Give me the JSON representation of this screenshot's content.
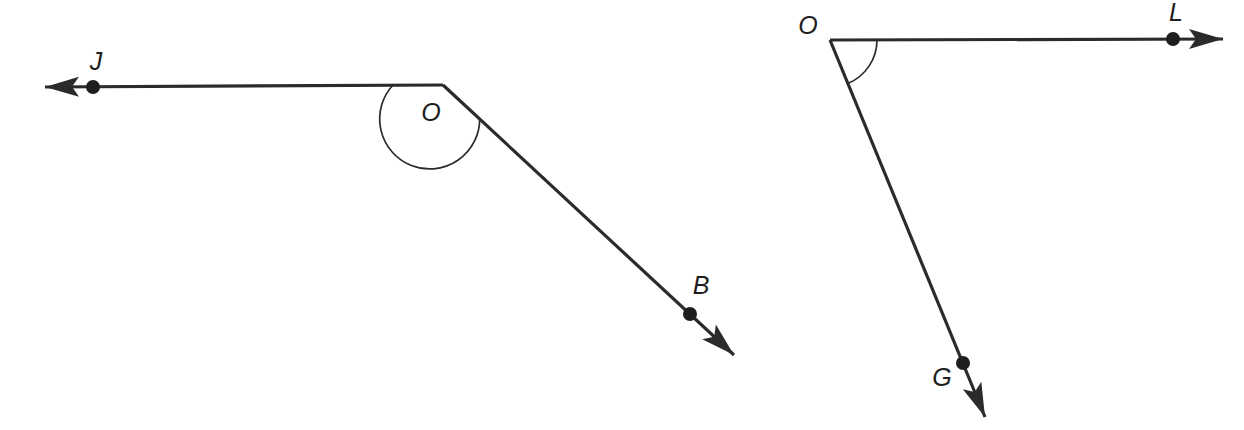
{
  "figure": {
    "type": "geometry-angle-diagram",
    "background_color": "#ffffff",
    "line_color": "#2b2b2b",
    "label_color": "#1e1e1e",
    "width": 1244,
    "height": 430,
    "diagrams": [
      {
        "id": "angle-job",
        "name": "angle-JOB",
        "vertex": {
          "label": "O",
          "x": 443,
          "y": 85,
          "label_x": 431,
          "label_y": 114
        },
        "rays": [
          {
            "name": "ray-OJ",
            "endpoint_label": "J",
            "from_x": 443,
            "from_y": 85,
            "to_x": 93,
            "to_y": 87,
            "tip_x": 45,
            "tip_y": 87,
            "dot_x": 93,
            "dot_y": 87,
            "label_x": 96,
            "label_y": 63,
            "direction_deg": 180
          },
          {
            "name": "ray-OB",
            "endpoint_label": "B",
            "from_x": 443,
            "from_y": 85,
            "to_x": 690,
            "to_y": 314,
            "tip_x": 734,
            "tip_y": 355,
            "dot_x": 690,
            "dot_y": 314,
            "label_x": 701,
            "label_y": 287,
            "direction_deg": 42.8
          }
        ],
        "arc": {
          "name": "angle-arc-JOB",
          "radius": 50,
          "start_deg": 180,
          "end_deg": 42.8,
          "sweep": "counterclockwise-over-top",
          "measure_type": "reflex-marked"
        }
      },
      {
        "id": "angle-log",
        "name": "angle-LOG",
        "vertex": {
          "label": "O",
          "x": 830,
          "y": 40,
          "label_x": 808,
          "label_y": 27
        },
        "rays": [
          {
            "name": "ray-OL",
            "endpoint_label": "L",
            "from_x": 830,
            "from_y": 40,
            "to_x": 1173,
            "to_y": 39,
            "tip_x": 1223,
            "tip_y": 39,
            "dot_x": 1173,
            "dot_y": 39,
            "label_x": 1176,
            "label_y": 14,
            "direction_deg": 0
          },
          {
            "name": "ray-OG",
            "endpoint_label": "G",
            "from_x": 830,
            "from_y": 40,
            "to_x": 963,
            "to_y": 363,
            "tip_x": 985,
            "tip_y": 417,
            "dot_x": 963,
            "dot_y": 363,
            "label_x": 942,
            "label_y": 379,
            "direction_deg": 67.6
          }
        ],
        "arc": {
          "name": "angle-arc-LOG",
          "radius": 47,
          "start_deg": 0,
          "end_deg": 67.6,
          "sweep": "clockwise-inside",
          "measure_type": "acute-marked"
        }
      }
    ]
  }
}
